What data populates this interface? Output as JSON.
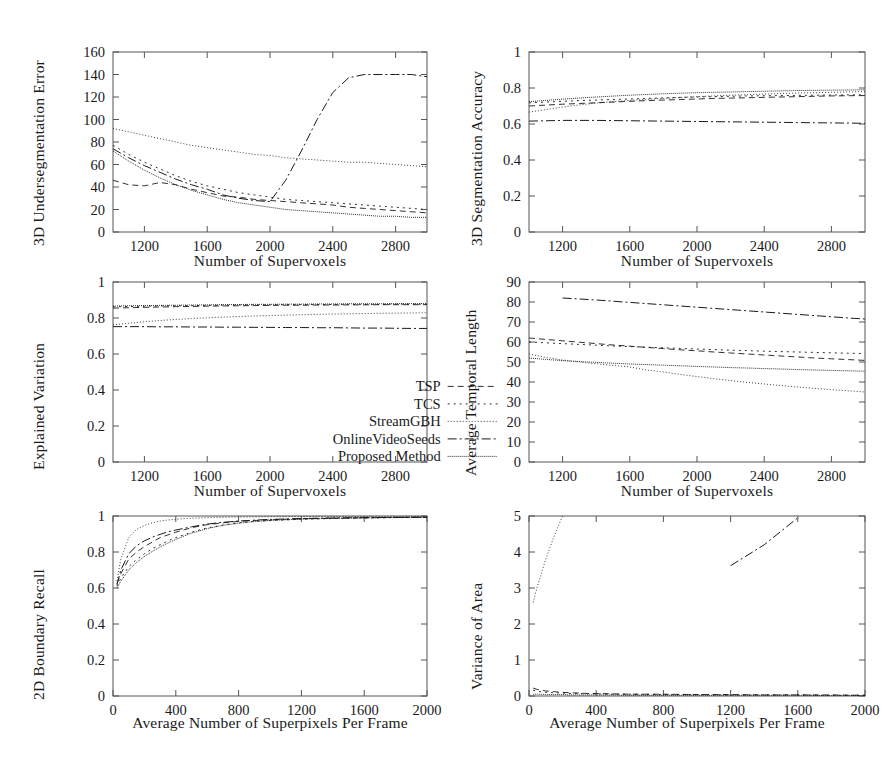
{
  "figure": {
    "rows": 3,
    "cols": 2,
    "background": "#ffffff",
    "ink": "#1a1a1a"
  },
  "legend": {
    "position": "inside-lower-right of Explained Variation panel",
    "entries": [
      {
        "label": "TSP",
        "dash": "6,4"
      },
      {
        "label": "TCS",
        "dash": "2,4"
      },
      {
        "label": "StreamGBH",
        "dash": "1,2"
      },
      {
        "label": "OnlineVideoSeeds",
        "dash": "9,3,2,3"
      },
      {
        "label": "Proposed Method",
        "dash": "1,1"
      }
    ]
  },
  "series_names": [
    "TSP",
    "TCS",
    "StreamGBH",
    "OnlineVideoSeeds",
    "Proposed Method"
  ],
  "chart_data": [
    {
      "id": "undersegmentation-error",
      "type": "line",
      "title": "",
      "xlabel": "Number of Supervoxels",
      "ylabel": "3D Undersegmentation Error",
      "xlim": [
        1000,
        3000
      ],
      "ylim": [
        0,
        160
      ],
      "xticks": [
        1200,
        1600,
        2000,
        2400,
        2800
      ],
      "yticks": [
        0,
        20,
        40,
        60,
        80,
        100,
        120,
        140,
        160
      ],
      "grid": false,
      "x": [
        1000,
        1100,
        1200,
        1300,
        1400,
        1500,
        1600,
        1700,
        1800,
        1900,
        2000,
        2100,
        2200,
        2300,
        2400,
        2500,
        2600,
        2700,
        2800,
        2900,
        3000
      ],
      "series": [
        {
          "name": "TSP",
          "values": [
            46,
            42,
            41,
            44,
            42,
            38,
            35,
            32,
            31,
            29,
            28,
            27,
            26,
            25,
            24,
            22,
            21,
            20,
            19,
            18,
            17
          ]
        },
        {
          "name": "TCS",
          "values": [
            77,
            69,
            62,
            56,
            50,
            45,
            41,
            38,
            35,
            33,
            31,
            29,
            28,
            27,
            26,
            25,
            24,
            23,
            22,
            21,
            20
          ]
        },
        {
          "name": "StreamGBH",
          "values": [
            92,
            89,
            86,
            83,
            80,
            77,
            75,
            73,
            71,
            69,
            68,
            66,
            65,
            64,
            63,
            62,
            62,
            61,
            60,
            59,
            58
          ]
        },
        {
          "name": "OnlineVideoSeeds",
          "values": [
            74,
            66,
            59,
            53,
            47,
            42,
            38,
            33,
            30,
            28,
            27,
            46,
            72,
            100,
            124,
            137,
            140,
            140,
            140,
            140,
            138
          ]
        },
        {
          "name": "Proposed Method",
          "values": [
            72,
            63,
            55,
            48,
            42,
            37,
            33,
            29,
            26,
            24,
            22,
            20,
            19,
            18,
            17,
            16,
            15,
            14,
            14,
            13,
            13
          ]
        }
      ]
    },
    {
      "id": "segmentation-accuracy",
      "type": "line",
      "title": "",
      "xlabel": "Number of Supervoxels",
      "ylabel": "3D Segmentation Accuracy",
      "xlim": [
        1000,
        3000
      ],
      "ylim": [
        0,
        1
      ],
      "xticks": [
        1200,
        1600,
        2000,
        2400,
        2800
      ],
      "yticks": [
        0,
        0.2,
        0.4,
        0.6,
        0.8,
        1
      ],
      "grid": false,
      "x": [
        1000,
        1100,
        1200,
        1300,
        1400,
        1500,
        1600,
        1700,
        1800,
        1900,
        2000,
        2100,
        2200,
        2300,
        2400,
        2500,
        2600,
        2700,
        2800,
        2900,
        3000
      ],
      "series": [
        {
          "name": "TSP",
          "values": [
            0.7,
            0.705,
            0.71,
            0.714,
            0.718,
            0.722,
            0.726,
            0.73,
            0.733,
            0.736,
            0.739,
            0.742,
            0.744,
            0.746,
            0.748,
            0.75,
            0.752,
            0.754,
            0.756,
            0.757,
            0.758
          ]
        },
        {
          "name": "TCS",
          "values": [
            0.718,
            0.722,
            0.726,
            0.73,
            0.733,
            0.736,
            0.739,
            0.742,
            0.745,
            0.748,
            0.75,
            0.752,
            0.754,
            0.756,
            0.757,
            0.758,
            0.759,
            0.76,
            0.761,
            0.762,
            0.762
          ]
        },
        {
          "name": "StreamGBH",
          "values": [
            0.666,
            0.68,
            0.694,
            0.706,
            0.716,
            0.724,
            0.731,
            0.737,
            0.742,
            0.747,
            0.752,
            0.756,
            0.76,
            0.763,
            0.766,
            0.769,
            0.772,
            0.774,
            0.776,
            0.778,
            0.78
          ]
        },
        {
          "name": "OnlineVideoSeeds",
          "values": [
            0.616,
            0.618,
            0.62,
            0.62,
            0.62,
            0.619,
            0.618,
            0.617,
            0.616,
            0.615,
            0.614,
            0.613,
            0.612,
            0.611,
            0.61,
            0.609,
            0.608,
            0.607,
            0.606,
            0.605,
            0.604
          ]
        },
        {
          "name": "Proposed Method",
          "values": [
            0.724,
            0.731,
            0.738,
            0.744,
            0.75,
            0.755,
            0.76,
            0.764,
            0.768,
            0.771,
            0.774,
            0.776,
            0.778,
            0.78,
            0.782,
            0.784,
            0.786,
            0.787,
            0.788,
            0.789,
            0.79
          ]
        }
      ]
    },
    {
      "id": "explained-variation",
      "type": "line",
      "title": "",
      "xlabel": "Number of Supervoxels",
      "ylabel": "Explained Variation",
      "xlim": [
        1000,
        3000
      ],
      "ylim": [
        0,
        1
      ],
      "xticks": [
        1200,
        1600,
        2000,
        2400,
        2800
      ],
      "yticks": [
        0,
        0.2,
        0.4,
        0.6,
        0.8,
        1
      ],
      "grid": false,
      "x": [
        1000,
        1100,
        1200,
        1300,
        1400,
        1500,
        1600,
        1700,
        1800,
        1900,
        2000,
        2100,
        2200,
        2300,
        2400,
        2500,
        2600,
        2700,
        2800,
        2900,
        3000
      ],
      "series": [
        {
          "name": "TSP",
          "values": [
            0.855,
            0.857,
            0.859,
            0.861,
            0.863,
            0.864,
            0.866,
            0.867,
            0.868,
            0.869,
            0.87,
            0.871,
            0.871,
            0.872,
            0.872,
            0.873,
            0.873,
            0.874,
            0.874,
            0.874,
            0.874
          ]
        },
        {
          "name": "TCS",
          "values": [
            0.862,
            0.864,
            0.865,
            0.867,
            0.868,
            0.869,
            0.87,
            0.871,
            0.872,
            0.873,
            0.873,
            0.874,
            0.874,
            0.875,
            0.875,
            0.876,
            0.876,
            0.876,
            0.877,
            0.877,
            0.877
          ]
        },
        {
          "name": "StreamGBH",
          "values": [
            0.762,
            0.771,
            0.779,
            0.786,
            0.792,
            0.797,
            0.801,
            0.805,
            0.808,
            0.811,
            0.814,
            0.816,
            0.818,
            0.82,
            0.822,
            0.823,
            0.825,
            0.826,
            0.827,
            0.828,
            0.829
          ]
        },
        {
          "name": "OnlineVideoSeeds",
          "values": [
            0.752,
            0.752,
            0.752,
            0.751,
            0.751,
            0.75,
            0.75,
            0.749,
            0.749,
            0.748,
            0.748,
            0.747,
            0.747,
            0.746,
            0.746,
            0.745,
            0.744,
            0.744,
            0.743,
            0.742,
            0.742
          ]
        },
        {
          "name": "Proposed Method",
          "values": [
            0.866,
            0.868,
            0.869,
            0.87,
            0.871,
            0.872,
            0.873,
            0.874,
            0.875,
            0.876,
            0.876,
            0.877,
            0.877,
            0.878,
            0.878,
            0.879,
            0.879,
            0.879,
            0.88,
            0.88,
            0.88
          ]
        }
      ]
    },
    {
      "id": "average-temporal-length",
      "type": "line",
      "title": "",
      "xlabel": "Number of Supervoxels",
      "ylabel": "Average Temporal Length",
      "xlim": [
        1000,
        3000
      ],
      "ylim": [
        0,
        90
      ],
      "xticks": [
        1200,
        1600,
        2000,
        2400,
        2800
      ],
      "yticks": [
        0,
        10,
        20,
        30,
        40,
        50,
        60,
        70,
        80,
        90
      ],
      "grid": false,
      "x": [
        1000,
        1100,
        1200,
        1300,
        1400,
        1500,
        1600,
        1700,
        1800,
        1900,
        2000,
        2100,
        2200,
        2300,
        2400,
        2500,
        2600,
        2700,
        2800,
        2900,
        3000
      ],
      "series": [
        {
          "name": "TSP",
          "values": [
            62.0,
            61.3,
            60.6,
            59.9,
            59.2,
            58.5,
            57.9,
            57.3,
            56.7,
            56.1,
            55.6,
            55.0,
            54.5,
            54.0,
            53.5,
            53.0,
            52.5,
            52.0,
            51.6,
            51.2,
            50.8
          ]
        },
        {
          "name": "TCS",
          "values": [
            60.0,
            59.6,
            59.2,
            58.8,
            58.4,
            58.0,
            57.7,
            57.4,
            57.1,
            56.8,
            56.5,
            56.2,
            55.9,
            55.7,
            55.4,
            55.2,
            55.0,
            54.8,
            54.6,
            54.4,
            54.2
          ]
        },
        {
          "name": "StreamGBH",
          "values": [
            54.0,
            52.3,
            51.0,
            50.0,
            49.1,
            48.3,
            47.5,
            46.0,
            45.0,
            43.8,
            42.7,
            41.7,
            40.7,
            39.8,
            39.0,
            38.2,
            37.5,
            36.8,
            36.2,
            35.6,
            35.0
          ]
        },
        {
          "name": "OnlineVideoSeeds",
          "values": [
            null,
            null,
            82.0,
            81.5,
            81.0,
            80.4,
            79.8,
            79.2,
            78.6,
            78.0,
            77.4,
            76.8,
            76.2,
            75.6,
            75.0,
            74.4,
            73.8,
            73.2,
            72.6,
            72.0,
            71.5
          ]
        },
        {
          "name": "Proposed Method",
          "values": [
            52.0,
            51.3,
            50.7,
            50.2,
            49.8,
            49.4,
            49.0,
            48.7,
            48.4,
            48.1,
            47.8,
            47.5,
            47.2,
            47.0,
            46.7,
            46.5,
            46.2,
            46.0,
            45.8,
            45.6,
            45.4
          ]
        }
      ]
    },
    {
      "id": "boundary-recall",
      "type": "line",
      "title": "",
      "xlabel": "Average Number of Superpixels Per Frame",
      "ylabel": "2D Boundary Recall",
      "xlim": [
        0,
        2000
      ],
      "ylim": [
        0,
        1
      ],
      "xticks": [
        0,
        400,
        800,
        1200,
        1600,
        2000
      ],
      "yticks": [
        0,
        0.2,
        0.4,
        0.6,
        0.8,
        1
      ],
      "grid": false,
      "x": [
        25,
        50,
        100,
        150,
        200,
        250,
        300,
        350,
        400,
        500,
        600,
        700,
        800,
        900,
        1000,
        1200,
        1400,
        1600,
        1800,
        2000
      ],
      "series": [
        {
          "name": "TSP",
          "values": [
            0.625,
            0.68,
            0.76,
            0.8,
            0.83,
            0.855,
            0.88,
            0.895,
            0.91,
            0.935,
            0.952,
            0.962,
            0.97,
            0.975,
            0.979,
            0.985,
            0.988,
            0.99,
            0.992,
            0.993
          ]
        },
        {
          "name": "TCS",
          "values": [
            0.61,
            0.655,
            0.718,
            0.758,
            0.79,
            0.818,
            0.84,
            0.862,
            0.88,
            0.91,
            0.934,
            0.95,
            0.962,
            0.97,
            0.975,
            0.982,
            0.986,
            0.989,
            0.991,
            0.992
          ]
        },
        {
          "name": "StreamGBH",
          "values": [
            0.64,
            0.76,
            0.88,
            0.925,
            0.948,
            0.962,
            0.972,
            0.978,
            0.982,
            0.988,
            0.991,
            0.993,
            0.994,
            0.995,
            0.996,
            0.997,
            0.997,
            0.998,
            0.998,
            0.998
          ]
        },
        {
          "name": "OnlineVideoSeeds",
          "values": [
            0.618,
            0.7,
            0.79,
            0.835,
            0.862,
            0.882,
            0.898,
            0.912,
            0.922,
            0.94,
            0.955,
            0.965,
            0.972,
            0.977,
            0.981,
            0.986,
            0.989,
            0.991,
            0.992,
            0.993
          ]
        },
        {
          "name": "Proposed Method",
          "values": [
            0.6,
            0.638,
            0.7,
            0.742,
            0.775,
            0.803,
            0.828,
            0.85,
            0.87,
            0.905,
            0.93,
            0.948,
            0.96,
            0.969,
            0.975,
            0.983,
            0.987,
            0.99,
            0.992,
            0.993
          ]
        }
      ]
    },
    {
      "id": "variance-of-area",
      "type": "line",
      "title": "",
      "xlabel": "Average Number of Superpixels Per Frame",
      "ylabel": "Variance of Area",
      "xlim": [
        0,
        2000
      ],
      "ylim": [
        0,
        5
      ],
      "xticks": [
        0,
        400,
        800,
        1200,
        1600,
        2000
      ],
      "yticks": [
        0,
        1,
        2,
        3,
        4,
        5
      ],
      "grid": false,
      "x": [
        25,
        50,
        100,
        150,
        200,
        250,
        300,
        350,
        400,
        500,
        600,
        800,
        1000,
        1200,
        1400,
        1600,
        1800,
        2000
      ],
      "series": [
        {
          "name": "TSP",
          "values": [
            0.22,
            0.18,
            0.14,
            0.12,
            0.1,
            0.09,
            0.08,
            0.07,
            0.07,
            0.06,
            0.05,
            0.05,
            0.04,
            0.04,
            0.03,
            0.03,
            0.03,
            0.02
          ]
        },
        {
          "name": "TCS",
          "values": [
            0.16,
            0.13,
            0.1,
            0.09,
            0.08,
            0.07,
            0.07,
            0.06,
            0.06,
            0.05,
            0.05,
            0.04,
            0.04,
            0.03,
            0.03,
            0.03,
            0.02,
            0.02
          ]
        },
        {
          "name": "StreamGBH",
          "values": [
            2.6,
            3.05,
            3.8,
            4.45,
            5.0,
            null,
            null,
            null,
            null,
            null,
            null,
            null,
            null,
            null,
            null,
            null,
            null,
            null
          ]
        },
        {
          "name": "OnlineVideoSeeds",
          "values": [
            null,
            null,
            null,
            null,
            null,
            null,
            null,
            null,
            null,
            null,
            null,
            null,
            null,
            3.62,
            4.2,
            4.95,
            null,
            null
          ]
        },
        {
          "name": "Proposed Method",
          "values": [
            0.05,
            0.05,
            0.04,
            0.04,
            0.04,
            0.03,
            0.03,
            0.03,
            0.03,
            0.03,
            0.02,
            0.02,
            0.02,
            0.02,
            0.02,
            0.02,
            0.01,
            0.01
          ]
        }
      ]
    }
  ]
}
